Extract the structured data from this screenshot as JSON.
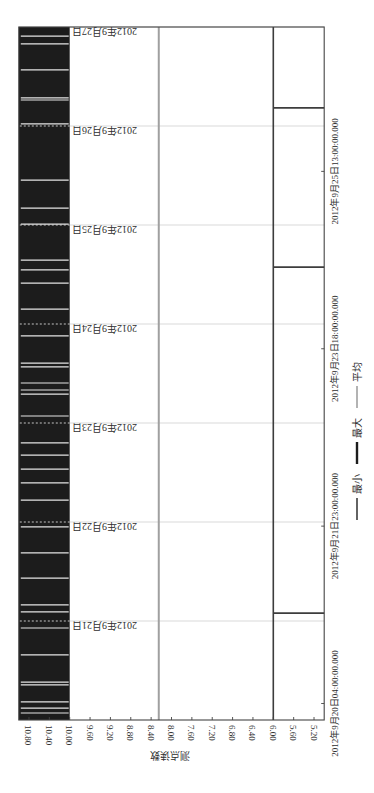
{
  "chart_data": {
    "type": "line",
    "orientation": "figure rotated 90 degrees counter-clockwise",
    "title": "",
    "xlabel": "",
    "ylabel": "测点读数",
    "xlim": [
      "2012-09-20 00:00",
      "2012-09-27 00:00"
    ],
    "xlim_hours": [
      0,
      168
    ],
    "x_ticks": [
      {
        "label": "2012年9月20日04:00:00.000",
        "hour": 4
      },
      {
        "label": "2012年9月21日23:00:00.000",
        "hour": 47
      },
      {
        "label": "2012年9月23日18:00:00.000",
        "hour": 90
      },
      {
        "label": "2012年9月25日13:00:00.000",
        "hour": 133
      }
    ],
    "x_grid": [
      {
        "label": "2012年9月21日",
        "hour": 24
      },
      {
        "label": "2012年9月22日",
        "hour": 48
      },
      {
        "label": "2012年9月23日",
        "hour": 72
      },
      {
        "label": "2012年9月24日",
        "hour": 96
      },
      {
        "label": "2012年9月25日",
        "hour": 120
      },
      {
        "label": "2012年9月26日",
        "hour": 144
      },
      {
        "label": "2012年9月27日",
        "hour": 168
      }
    ],
    "ylim": [
      5.0,
      11.0
    ],
    "y_ticks": [
      "10.80",
      "10.40",
      "10.00",
      "9.60",
      "9.20",
      "8.80",
      "8.40",
      "8.00",
      "7.60",
      "7.20",
      "6.80",
      "6.40",
      "6.00",
      "5.60",
      "5.20"
    ],
    "grid": {
      "x": true,
      "y": false
    },
    "legend": {
      "position": "bottom",
      "entries": [
        "最小",
        "最大",
        "平均"
      ]
    },
    "series": [
      {
        "name": "最小",
        "color": "#3d3d3d",
        "stroke_width": 1.6,
        "value": 6.0,
        "dip_value": 5.0,
        "dip_hours": [
          25.9,
          109.8,
          148.4
        ]
      },
      {
        "name": "最大",
        "color": "#1c1c1c",
        "stroke_width": 2.6,
        "range": [
          10.0,
          11.0
        ],
        "steady_hours": [
          1.7,
          2.9,
          4.4,
          8.5,
          9.2,
          15.8,
          22.3,
          26.2,
          27.9,
          34.4,
          40.5,
          46.8,
          53.3,
          57.5,
          60.8,
          64.2,
          67.2,
          73.7,
          79.0,
          80.0,
          81.7,
          85.6,
          86.5,
          93.1,
          99.6,
          105.9,
          109.1,
          111.5,
          120.2,
          124.1,
          130.9,
          144.5,
          150.3,
          150.8,
          157.6,
          163.9,
          165.8
        ]
      },
      {
        "name": "平均",
        "color": "#a0a0a0",
        "stroke_width": 2.0,
        "value": 8.25
      }
    ]
  }
}
